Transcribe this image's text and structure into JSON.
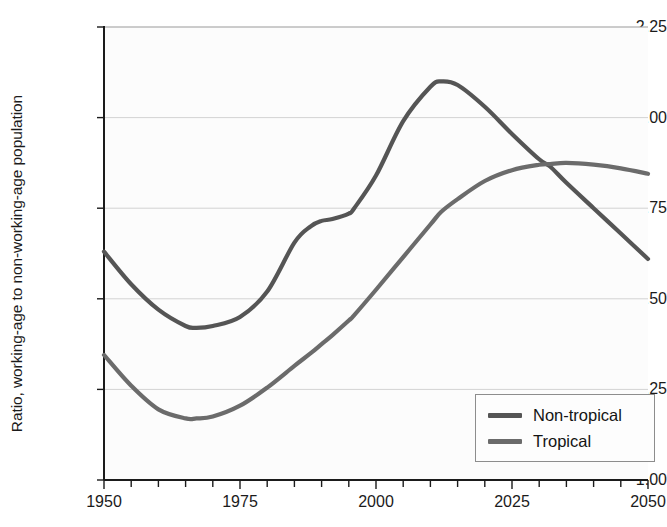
{
  "chart_data": {
    "type": "line",
    "title": "",
    "subtitle": "",
    "xlabel": "",
    "ylabel": "Ratio, working-age to non-working-age population",
    "xlim": [
      1950,
      2050
    ],
    "ylim": [
      1.0,
      2.25
    ],
    "ytick_labels": [
      "2.25",
      "2.00",
      "1.75",
      "1.50",
      "1.25",
      "1.00"
    ],
    "ytick_values": [
      2.25,
      2.0,
      1.75,
      1.5,
      1.25,
      1.0
    ],
    "xtick_labels": [
      "1950",
      "1975",
      "2000",
      "2025",
      "2050"
    ],
    "xtick_values": [
      1950,
      1975,
      2000,
      2025,
      2050
    ],
    "x_minor_tick_interval": 5,
    "grid": "horizontal",
    "legend_position": "bottom-right",
    "legend_entries": [
      "Non-tropical",
      "Tropical"
    ],
    "x": [
      1950,
      1955,
      1960,
      1965,
      1967,
      1970,
      1975,
      1980,
      1985,
      1988,
      1990,
      1992,
      1995,
      1996,
      2000,
      2005,
      2010,
      2012,
      2015,
      2020,
      2025,
      2030,
      2032,
      2035,
      2040,
      2045,
      2050
    ],
    "series": [
      {
        "name": "Non-tropical",
        "color": "#555555",
        "values": [
          1.63,
          1.54,
          1.47,
          1.425,
          1.42,
          1.425,
          1.45,
          1.52,
          1.655,
          1.7,
          1.715,
          1.72,
          1.735,
          1.75,
          1.84,
          1.99,
          2.085,
          2.1,
          2.09,
          2.03,
          1.955,
          1.885,
          1.865,
          1.82,
          1.75,
          1.68,
          1.61
        ]
      },
      {
        "name": "Tropical",
        "color": "#6b6b6b",
        "values": [
          1.345,
          1.26,
          1.195,
          1.17,
          1.17,
          1.175,
          1.205,
          1.255,
          1.315,
          1.35,
          1.375,
          1.4,
          1.44,
          1.455,
          1.525,
          1.615,
          1.705,
          1.74,
          1.775,
          1.825,
          1.855,
          1.87,
          1.872,
          1.875,
          1.87,
          1.86,
          1.845
        ]
      }
    ]
  },
  "axes": {
    "y_title": "Ratio, working-age to non-working-age population"
  },
  "legend": {
    "items": [
      {
        "label": "Non-tropical",
        "color": "#555555"
      },
      {
        "label": "Tropical",
        "color": "#6b6b6b"
      }
    ]
  }
}
